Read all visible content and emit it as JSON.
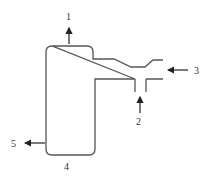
{
  "diagram": {
    "type": "process-vessel-schematic",
    "stroke_color": "#555555",
    "labels": {
      "top_outlet": "1",
      "bottom_inlet": "2",
      "side_inlet": "3",
      "vessel_bottom": "4",
      "side_outlet": "5"
    },
    "streams": [
      {
        "id": "1",
        "direction": "out",
        "position": "top of vessel"
      },
      {
        "id": "2",
        "direction": "in",
        "position": "branch inlet from below"
      },
      {
        "id": "3",
        "direction": "in",
        "position": "horizontal inlet from right"
      },
      {
        "id": "4",
        "direction": "none",
        "position": "vessel bottom label"
      },
      {
        "id": "5",
        "direction": "out",
        "position": "lower left outlet"
      }
    ]
  }
}
